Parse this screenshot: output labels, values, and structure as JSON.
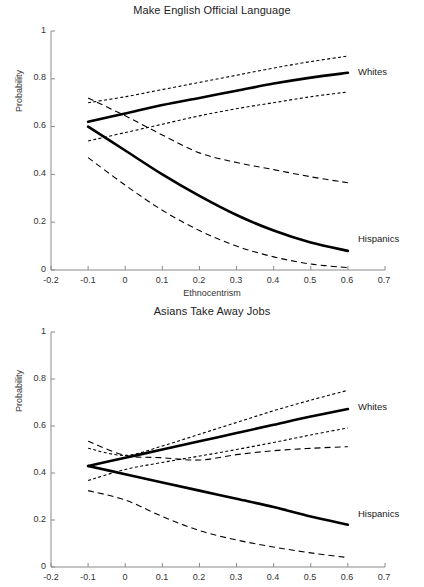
{
  "figure": {
    "ylabel": "Probability",
    "xlabel": "Ethnocentrism",
    "xticks": [
      "-0.2",
      "-0.1",
      "0",
      "0.1",
      "0.2",
      "0.3",
      "0.4",
      "0.5",
      "0.6",
      "0.7"
    ],
    "yticks": [
      "1",
      "0.8",
      "0.6",
      "0.4",
      "0.2",
      "0"
    ],
    "label_whites": "Whites",
    "label_hispanics": "Hispanics",
    "color_line": "#000000",
    "color_axis": "#8a8a8a"
  },
  "chart_data": [
    {
      "type": "line",
      "title": "Make English Official Language",
      "xlabel": "Ethnocentrism",
      "ylabel": "Probability",
      "xlim": [
        -0.2,
        0.7
      ],
      "ylim": [
        0,
        1
      ],
      "xticks": [
        -0.2,
        -0.1,
        0,
        0.1,
        0.2,
        0.3,
        0.4,
        0.5,
        0.6,
        0.7
      ],
      "yticks": [
        0,
        0.2,
        0.4,
        0.6,
        0.8,
        1
      ],
      "grid": false,
      "legend": "inline-right",
      "x": [
        -0.1,
        0.0,
        0.1,
        0.2,
        0.3,
        0.4,
        0.5,
        0.6
      ],
      "series": [
        {
          "name": "Whites",
          "style": "solid",
          "values": [
            0.62,
            0.655,
            0.69,
            0.72,
            0.75,
            0.78,
            0.805,
            0.825
          ]
        },
        {
          "name": "Whites upper CI",
          "style": "dotted",
          "values": [
            0.7,
            0.725,
            0.755,
            0.785,
            0.815,
            0.845,
            0.872,
            0.895
          ]
        },
        {
          "name": "Whites lower CI",
          "style": "dotted",
          "values": [
            0.54,
            0.575,
            0.61,
            0.645,
            0.675,
            0.7,
            0.725,
            0.745
          ]
        },
        {
          "name": "Hispanics",
          "style": "solid",
          "values": [
            0.6,
            0.5,
            0.4,
            0.31,
            0.23,
            0.165,
            0.115,
            0.08
          ]
        },
        {
          "name": "Hispanics upper CI",
          "style": "dashed",
          "values": [
            0.72,
            0.645,
            0.565,
            0.49,
            0.45,
            0.42,
            0.39,
            0.365
          ]
        },
        {
          "name": "Hispanics lower CI",
          "style": "dashed",
          "values": [
            0.47,
            0.355,
            0.25,
            0.165,
            0.1,
            0.055,
            0.025,
            0.01
          ]
        }
      ]
    },
    {
      "type": "line",
      "title": "Asians Take Away Jobs",
      "xlabel": "",
      "ylabel": "Probability",
      "xlim": [
        -0.2,
        0.7
      ],
      "ylim": [
        0,
        1
      ],
      "xticks": [
        -0.2,
        -0.1,
        0,
        0.1,
        0.2,
        0.3,
        0.4,
        0.5,
        0.6,
        0.7
      ],
      "yticks": [
        0,
        0.2,
        0.4,
        0.6,
        0.8,
        1
      ],
      "grid": false,
      "legend": "inline-right",
      "x": [
        -0.1,
        0.0,
        0.1,
        0.2,
        0.3,
        0.4,
        0.5,
        0.6
      ],
      "series": [
        {
          "name": "Whites",
          "style": "solid",
          "values": [
            0.43,
            0.465,
            0.5,
            0.535,
            0.57,
            0.605,
            0.64,
            0.672
          ]
        },
        {
          "name": "Whites upper CI",
          "style": "dotted",
          "values": [
            0.505,
            0.475,
            0.515,
            0.565,
            0.615,
            0.665,
            0.71,
            0.752
          ]
        },
        {
          "name": "Whites lower CI",
          "style": "dotted",
          "values": [
            0.368,
            0.415,
            0.445,
            0.472,
            0.5,
            0.53,
            0.562,
            0.592
          ]
        },
        {
          "name": "Hispanics",
          "style": "solid",
          "values": [
            0.43,
            0.395,
            0.36,
            0.325,
            0.29,
            0.255,
            0.215,
            0.18
          ]
        },
        {
          "name": "Hispanics upper CI",
          "style": "dashed",
          "values": [
            0.535,
            0.475,
            0.465,
            0.455,
            0.478,
            0.495,
            0.505,
            0.512
          ]
        },
        {
          "name": "Hispanics lower CI",
          "style": "dashed",
          "values": [
            0.325,
            0.285,
            0.215,
            0.155,
            0.115,
            0.085,
            0.06,
            0.04
          ]
        }
      ]
    }
  ]
}
